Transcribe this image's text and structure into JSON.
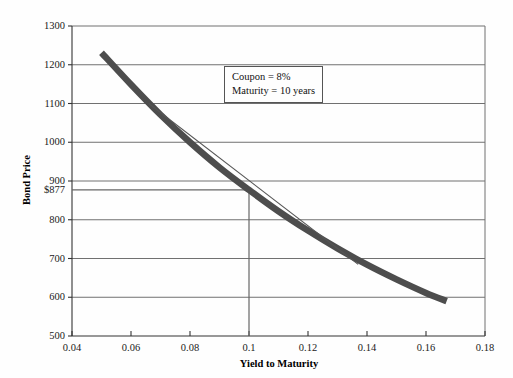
{
  "chart_data": {
    "type": "line",
    "title": "",
    "xlabel": "Yield to Maturity",
    "ylabel": "Bond Price",
    "xlim": [
      0.04,
      0.18
    ],
    "ylim": [
      500,
      1300
    ],
    "grid": true,
    "legend_position": "none",
    "xticks": [
      "0.04",
      "0.06",
      "0.08",
      "0.1",
      "0.12",
      "0.14",
      "0.16",
      "0.18"
    ],
    "xtick_values": [
      0.04,
      0.06,
      0.08,
      0.1,
      0.12,
      0.14,
      0.16,
      0.18
    ],
    "yticks": [
      "500",
      "600",
      "700",
      "800",
      "900",
      "1000",
      "1100",
      "1200",
      "1300"
    ],
    "ytick_values": [
      500,
      600,
      700,
      800,
      900,
      1000,
      1100,
      1200,
      1300
    ],
    "highlight_ytick": {
      "label": "$877",
      "value": 877
    },
    "reference_lines": {
      "horizontal_price": 877,
      "vertical_yield": 0.1
    },
    "series": [
      {
        "name": "Bond price curve",
        "style": "thick-convex-curve",
        "color": "#4d4d4d",
        "x": [
          0.05,
          0.06,
          0.07,
          0.08,
          0.09,
          0.1,
          0.11,
          0.12,
          0.13,
          0.14,
          0.15,
          0.16,
          0.167
        ],
        "values": [
          1231,
          1149,
          1071,
          1000,
          935,
          877,
          822,
          772,
          726,
          684,
          646,
          611,
          590
        ]
      },
      {
        "name": "Duration tangent line",
        "style": "thin-straight-line",
        "color": "#555555",
        "x": [
          0.066,
          0.137
        ],
        "values": [
          1100,
          685
        ]
      }
    ],
    "annotations": [
      {
        "name": "bond-parameters-box",
        "lines": [
          "Coupon = 8%",
          "Maturity = 10 years"
        ]
      }
    ]
  },
  "annotation": {
    "line1": "Coupon = 8%",
    "line2": "Maturity = 10 years"
  },
  "axes": {
    "x_title": "Yield to Maturity",
    "y_title": "Bond Price"
  }
}
